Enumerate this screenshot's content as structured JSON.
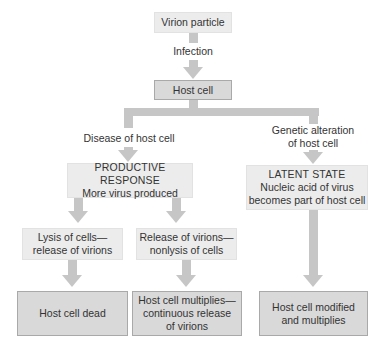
{
  "diagram": {
    "colors": {
      "light_box": "#ececec",
      "dark_box": "#d9d9d9",
      "arrow": "#c6c6c6",
      "text": "#333333"
    },
    "nodes": {
      "virion": {
        "text": "Virion particle"
      },
      "host_cell": {
        "text": "Host cell"
      },
      "productive": {
        "title": "PRODUCTIVE RESPONSE",
        "subtitle": "More virus produced"
      },
      "latent": {
        "title": "LATENT STATE",
        "line1": "Nucleic acid of virus",
        "line2": "becomes part of host cell"
      },
      "lysis": {
        "line1": "Lysis of cells—",
        "line2": "release of virions"
      },
      "release": {
        "line1": "Release of virions—",
        "line2": "nonlysis of cells"
      },
      "dead": {
        "text": "Host cell dead"
      },
      "multiplies": {
        "line1": "Host cell multiplies—",
        "line2": "continuous release",
        "line3": "of virions"
      },
      "modified": {
        "line1": "Host cell modified",
        "line2": "and multiplies"
      }
    },
    "edge_labels": {
      "infection": "Infection",
      "disease": "Disease of host cell",
      "genetic_line1": "Genetic alteration",
      "genetic_line2": "of host cell"
    },
    "edges": [
      {
        "from": "virion",
        "to": "host_cell",
        "label": "Infection"
      },
      {
        "from": "host_cell",
        "to": "productive",
        "label": "Disease of host cell"
      },
      {
        "from": "host_cell",
        "to": "latent",
        "label": "Genetic alteration of host cell"
      },
      {
        "from": "productive",
        "to": "lysis"
      },
      {
        "from": "productive",
        "to": "release"
      },
      {
        "from": "lysis",
        "to": "dead"
      },
      {
        "from": "release",
        "to": "multiplies"
      },
      {
        "from": "latent",
        "to": "modified"
      }
    ]
  }
}
